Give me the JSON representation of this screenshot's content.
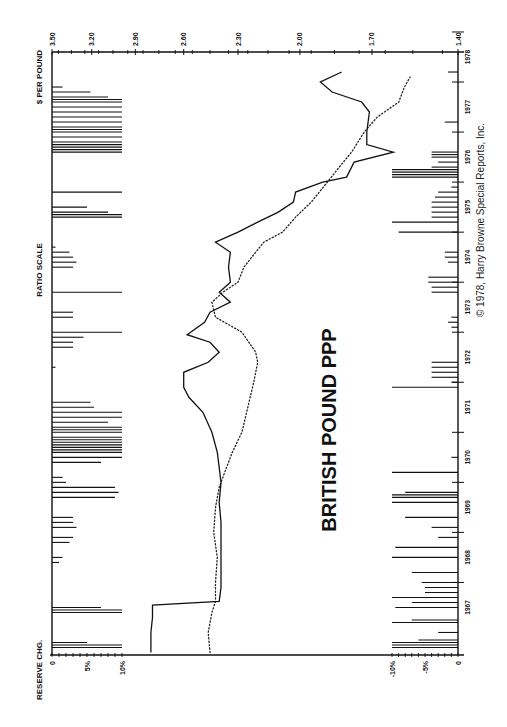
{
  "chart_data": {
    "type": "line",
    "title": "BRITISH POUND PPP",
    "orientation": "rotated-90-ccw",
    "price_axis": {
      "label": "$ PER POUND",
      "scale": "RATIO SCALE",
      "ticks": [
        "3.50",
        "3.20",
        "2.90",
        "2.60",
        "2.30",
        "2.00",
        "1.70",
        "1.40"
      ],
      "range": [
        1.4,
        3.5
      ]
    },
    "time_axis": {
      "ticks": [
        "1967",
        "1968",
        "1969",
        "1970",
        "1971",
        "1972",
        "1973",
        "1974",
        "1975",
        "1976",
        "1977",
        "1978"
      ],
      "range": [
        1967,
        1978.5
      ]
    },
    "reserve_axis": {
      "label": "RESERVE CHG.",
      "positive_ticks": [
        "0",
        "5%",
        "10%"
      ],
      "negative_ticks": [
        "-10%",
        "-5%",
        "0"
      ]
    },
    "series": [
      {
        "name": "Market exchange rate",
        "style": "solid",
        "points": [
          [
            1966.6,
            2.8
          ],
          [
            1967.0,
            2.8
          ],
          [
            1967.3,
            2.79
          ],
          [
            1967.55,
            2.79
          ],
          [
            1967.62,
            2.4
          ],
          [
            1967.9,
            2.39
          ],
          [
            1968.3,
            2.39
          ],
          [
            1968.8,
            2.39
          ],
          [
            1969.2,
            2.39
          ],
          [
            1969.6,
            2.4
          ],
          [
            1970.0,
            2.39
          ],
          [
            1970.3,
            2.4
          ],
          [
            1970.6,
            2.41
          ],
          [
            1971.0,
            2.44
          ],
          [
            1971.4,
            2.49
          ],
          [
            1971.7,
            2.57
          ],
          [
            1971.9,
            2.6
          ],
          [
            1972.2,
            2.6
          ],
          [
            1972.4,
            2.46
          ],
          [
            1972.6,
            2.4
          ],
          [
            1972.8,
            2.45
          ],
          [
            1972.95,
            2.58
          ],
          [
            1973.2,
            2.48
          ],
          [
            1973.4,
            2.45
          ],
          [
            1973.6,
            2.34
          ],
          [
            1973.8,
            2.4
          ],
          [
            1974.0,
            2.34
          ],
          [
            1974.3,
            2.35
          ],
          [
            1974.6,
            2.34
          ],
          [
            1974.8,
            2.42
          ],
          [
            1975.0,
            2.3
          ],
          [
            1975.2,
            2.2
          ],
          [
            1975.4,
            2.1
          ],
          [
            1975.6,
            2.03
          ],
          [
            1975.8,
            2.02
          ],
          [
            1976.0,
            1.9
          ],
          [
            1976.1,
            1.8
          ],
          [
            1976.4,
            1.77
          ],
          [
            1976.6,
            1.62
          ],
          [
            1976.75,
            1.72
          ],
          [
            1977.0,
            1.72
          ],
          [
            1977.4,
            1.71
          ],
          [
            1977.6,
            1.74
          ],
          [
            1977.8,
            1.86
          ],
          [
            1978.0,
            1.91
          ],
          [
            1978.2,
            1.82
          ]
        ]
      },
      {
        "name": "Purchasing power parity",
        "style": "dotted",
        "points": [
          [
            1966.6,
            2.45
          ],
          [
            1967.0,
            2.46
          ],
          [
            1967.4,
            2.44
          ],
          [
            1967.62,
            2.42
          ],
          [
            1968.0,
            2.42
          ],
          [
            1968.5,
            2.41
          ],
          [
            1969.0,
            2.43
          ],
          [
            1969.5,
            2.42
          ],
          [
            1969.9,
            2.4
          ],
          [
            1970.2,
            2.37
          ],
          [
            1970.6,
            2.33
          ],
          [
            1971.0,
            2.28
          ],
          [
            1971.5,
            2.25
          ],
          [
            1972.0,
            2.22
          ],
          [
            1972.4,
            2.2
          ],
          [
            1972.6,
            2.21
          ],
          [
            1973.0,
            2.28
          ],
          [
            1973.3,
            2.42
          ],
          [
            1973.6,
            2.44
          ],
          [
            1973.8,
            2.38
          ],
          [
            1974.0,
            2.3
          ],
          [
            1974.3,
            2.27
          ],
          [
            1974.6,
            2.21
          ],
          [
            1974.8,
            2.17
          ],
          [
            1975.0,
            2.08
          ],
          [
            1975.3,
            2.02
          ],
          [
            1975.6,
            1.95
          ],
          [
            1976.0,
            1.88
          ],
          [
            1976.3,
            1.83
          ],
          [
            1976.6,
            1.78
          ],
          [
            1977.0,
            1.73
          ],
          [
            1977.3,
            1.68
          ],
          [
            1977.6,
            1.6
          ],
          [
            1977.9,
            1.58
          ],
          [
            1978.1,
            1.56
          ]
        ]
      }
    ],
    "annotations": [
      "© 1978, Harry Browne Special Reports, Inc."
    ],
    "grid": false,
    "legend": "none"
  },
  "labels": {
    "price_axis_title": "$ PER POUND",
    "scale_note": "RATIO SCALE",
    "reserve_title": "RESERVE CHG.",
    "chart_title": "BRITISH POUND PPP",
    "copyright": "© 1978, Harry Browne Special Reports, Inc."
  }
}
